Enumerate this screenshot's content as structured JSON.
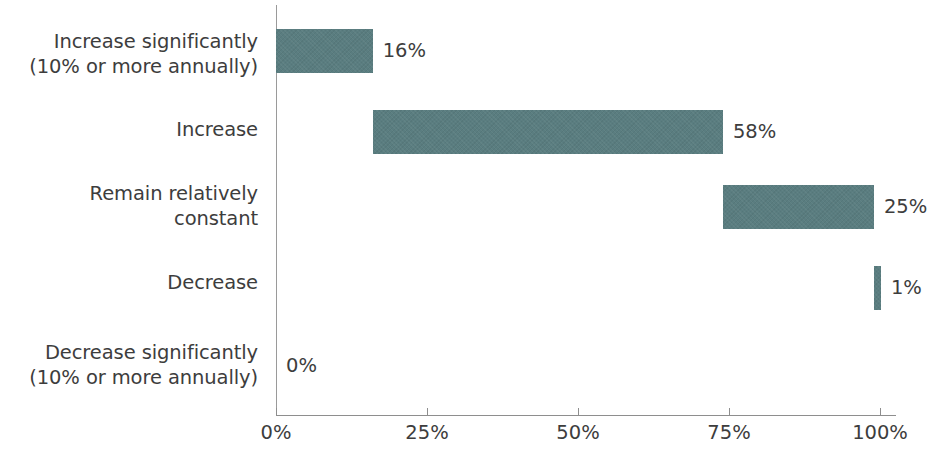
{
  "chart_data": {
    "type": "bar",
    "orientation": "horizontal",
    "layout": "stacked-waterfall-cumulative",
    "title": "",
    "subtitle": "",
    "xlabel": "",
    "ylabel": "",
    "xlim": [
      0,
      100
    ],
    "grid": false,
    "legend": null,
    "bar_color": "#5a7d80",
    "axis_color": "#8e8e8e",
    "text_color": "#3d3d3d",
    "background_color": "#ffffff",
    "categories": [
      "Increase significantly\n(10% or more annually)",
      "Increase",
      "Remain relatively\nconstant",
      "Decrease",
      "Decrease significantly\n(10% or more annually)"
    ],
    "values": [
      16,
      58,
      25,
      1,
      0
    ],
    "value_labels": [
      "16%",
      "58%",
      "25%",
      "1%",
      "0%"
    ],
    "cumulative_start": [
      0,
      16,
      74,
      99,
      100
    ],
    "cumulative_end": [
      16,
      74,
      99,
      100,
      100
    ],
    "xticks": [
      0,
      25,
      50,
      75,
      100
    ],
    "xtick_labels": [
      "0%",
      "25%",
      "50%",
      "75%",
      "100%"
    ]
  }
}
